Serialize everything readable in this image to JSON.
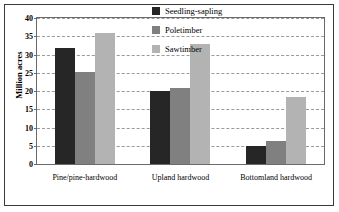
{
  "chart_data": {
    "type": "bar",
    "title": "",
    "xlabel": "",
    "ylabel": "Million acres",
    "ylim": [
      0,
      40
    ],
    "yticks": [
      0,
      5,
      10,
      15,
      20,
      25,
      30,
      35,
      40
    ],
    "grid": true,
    "legend_position": "top-right-inside",
    "categories": [
      "Pine/pine-hardwood",
      "Upland hardwood",
      "Bottomland hardwood"
    ],
    "series": [
      {
        "name": "Seedling-sapling",
        "color": "#262626",
        "values": [
          31.8,
          20.1,
          5.0
        ]
      },
      {
        "name": "Poletimber",
        "color": "#808080",
        "values": [
          25.3,
          20.7,
          6.2
        ]
      },
      {
        "name": "Sawtimber",
        "color": "#b3b3b3",
        "values": [
          36.0,
          33.0,
          18.4
        ]
      }
    ]
  },
  "axis": {
    "y_title": "Million acres",
    "y_tick_labels": [
      "0",
      "5",
      "10",
      "15",
      "20",
      "25",
      "30",
      "35",
      "40"
    ],
    "x_tick_labels": [
      "Pine/pine-hardwood",
      "Upland hardwood",
      "Bottomland hardwood"
    ]
  },
  "legend": {
    "entries": [
      {
        "label": "Seedling-sapling",
        "color": "#262626"
      },
      {
        "label": "Poletimber",
        "color": "#808080"
      },
      {
        "label": "Sawtimber",
        "color": "#b3b3b3"
      }
    ]
  },
  "colors": {
    "seedling_sapling": "#262626",
    "poletimber": "#808080",
    "sawtimber": "#b3b3b3",
    "axis": "#6a6a6a",
    "grid": "#9a9a9a",
    "frame": "#3a3a3a",
    "background": "#ffffff"
  }
}
